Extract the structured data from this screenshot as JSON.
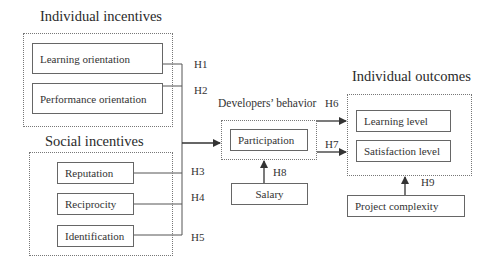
{
  "diagram": {
    "groups": {
      "individual_incentives": {
        "title": "Individual incentives",
        "items": [
          "Learning orientation",
          "Performance orientation"
        ]
      },
      "social_incentives": {
        "title": "Social incentives",
        "items": [
          "Reputation",
          "Reciprocity",
          "Identification"
        ]
      },
      "developers_behavior": {
        "title": "Developers’ behavior",
        "items": [
          "Participation"
        ]
      },
      "individual_outcomes": {
        "title": "Individual outcomes",
        "items": [
          "Learning level",
          "Satisfaction level"
        ]
      }
    },
    "moderators": {
      "salary": "Salary",
      "project_complexity": "Project complexity"
    },
    "hypotheses": [
      "H1",
      "H2",
      "H3",
      "H4",
      "H5",
      "H6",
      "H7",
      "H8",
      "H9"
    ],
    "edges": [
      {
        "from": "Learning orientation",
        "to": "Participation",
        "label": "H1"
      },
      {
        "from": "Performance orientation",
        "to": "Participation",
        "label": "H2"
      },
      {
        "from": "Reputation",
        "to": "Participation",
        "label": "H3"
      },
      {
        "from": "Reciprocity",
        "to": "Participation",
        "label": "H4"
      },
      {
        "from": "Identification",
        "to": "Participation",
        "label": "H5"
      },
      {
        "from": "Participation",
        "to": "Learning level",
        "label": "H6"
      },
      {
        "from": "Participation",
        "to": "Satisfaction level",
        "label": "H7"
      },
      {
        "from": "Salary",
        "to": "Developers’ behavior",
        "label": "H8"
      },
      {
        "from": "Project complexity",
        "to": "Individual outcomes",
        "label": "H9"
      }
    ],
    "colors": {
      "line": "#333333",
      "box_border": "#666666",
      "group_border": "#777777"
    }
  }
}
